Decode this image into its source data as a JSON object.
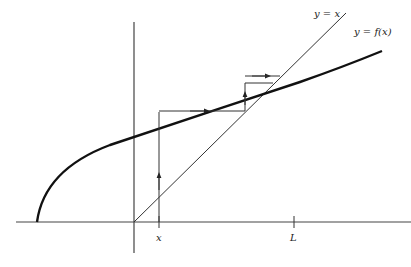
{
  "figure": {
    "labels": {
      "diagonal": "y = x",
      "curve": "y = f(x)",
      "start_tick": "x",
      "limit_tick": "L"
    },
    "colors": {
      "ink": "#222222",
      "background": "#ffffff"
    }
  }
}
